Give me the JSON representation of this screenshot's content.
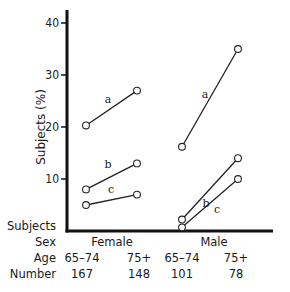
{
  "chart_data": {
    "type": "line",
    "title": "",
    "xlabel": "",
    "ylabel": "Subjects (%)",
    "ylim": [
      0,
      42
    ],
    "yticks": [
      10,
      20,
      30,
      40
    ],
    "grid": false,
    "legend": "none (series labeled inline: a, b, c)",
    "groups": [
      {
        "sex": "Female",
        "categories": [
          "65–74",
          "75+"
        ],
        "numbers": [
          167,
          148
        ],
        "series": [
          {
            "name": "a",
            "values": [
              20.3,
              27.0
            ]
          },
          {
            "name": "b",
            "values": [
              8.0,
              13.0
            ]
          },
          {
            "name": "c",
            "values": [
              5.0,
              7.0
            ]
          }
        ]
      },
      {
        "sex": "Male",
        "categories": [
          "65–74",
          "75+"
        ],
        "numbers": [
          101,
          78
        ],
        "series": [
          {
            "name": "a",
            "values": [
              16.2,
              35.0
            ]
          },
          {
            "name": "b",
            "values": [
              2.2,
              14.0
            ]
          },
          {
            "name": "c",
            "values": [
              0.7,
              10.0
            ]
          }
        ]
      }
    ]
  },
  "table": {
    "row_labels": {
      "subjects": "Subjects",
      "sex": "Sex",
      "age": "Age",
      "number": "Number"
    },
    "sex": [
      "Female",
      "Male"
    ],
    "age": [
      "65–74",
      "75+",
      "65–74",
      "75+"
    ],
    "number": [
      "167",
      "148",
      "101",
      "78"
    ]
  },
  "colors": {
    "axis": "#111111",
    "line": "#222222",
    "marker_fill": "#ffffff"
  }
}
